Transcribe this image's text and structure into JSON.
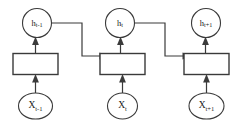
{
  "diagram": {
    "stroke_color": "#3a3a3a",
    "text_color": "#1a1a1a",
    "background_color": "#ffffff",
    "timesteps": [
      {
        "id": "t-minus-1",
        "hidden": {
          "base": "h",
          "subscript": "t-1"
        },
        "input": {
          "base": "X",
          "subscript": "t-1"
        },
        "cell_label": ""
      },
      {
        "id": "t",
        "hidden": {
          "base": "h",
          "subscript": "t"
        },
        "input": {
          "base": "X",
          "subscript": "t"
        },
        "cell_label": ""
      },
      {
        "id": "t-plus-1",
        "hidden": {
          "base": "h",
          "subscript": "t+1"
        },
        "input": {
          "base": "X",
          "subscript": "t+1"
        },
        "cell_label": ""
      }
    ]
  }
}
